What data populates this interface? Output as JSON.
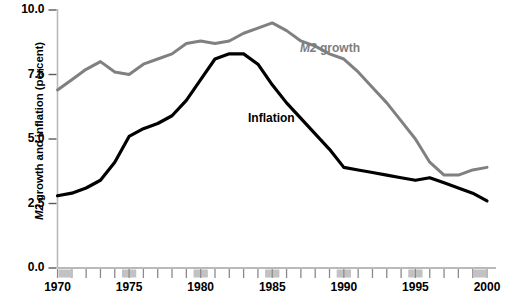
{
  "chart_data": {
    "type": "line",
    "title": "",
    "xlabel": "",
    "ylabel": "M2 growth and inflation (percent)",
    "ylabel_italic_prefix": "M2",
    "ylabel_rest": " growth and inflation (percent)",
    "xlim": [
      1970,
      2000
    ],
    "ylim": [
      0.0,
      10.0
    ],
    "grid": false,
    "legend_position": "inline-annotations",
    "ytick_labels": [
      "0.0",
      "2.5",
      "5.0",
      "7.5",
      "10.0"
    ],
    "ytick_values": [
      0.0,
      2.5,
      5.0,
      7.5,
      10.0
    ],
    "xtick_labels": [
      "1970",
      "1975",
      "1980",
      "1985",
      "1990",
      "1995",
      "2000"
    ],
    "xtick_values": [
      1970,
      1975,
      1980,
      1985,
      1990,
      1995,
      2000
    ],
    "minor_xticks": [
      1971,
      1972,
      1973,
      1974,
      1976,
      1977,
      1978,
      1979,
      1981,
      1982,
      1983,
      1984,
      1986,
      1987,
      1988,
      1989,
      1991,
      1992,
      1993,
      1994,
      1996,
      1997,
      1998,
      1999
    ],
    "x": [
      1970,
      1971,
      1972,
      1973,
      1974,
      1975,
      1976,
      1977,
      1978,
      1979,
      1980,
      1981,
      1982,
      1983,
      1984,
      1985,
      1986,
      1987,
      1988,
      1989,
      1990,
      1991,
      1992,
      1993,
      1994,
      1995,
      1996,
      1997,
      1998,
      1999,
      2000
    ],
    "series": [
      {
        "name": "M2 growth",
        "color": "#808080",
        "label_text": "M2 growth",
        "label_italic_prefix": "M2",
        "label_rest": " growth",
        "values": [
          6.9,
          7.3,
          7.7,
          8.0,
          7.6,
          7.5,
          7.9,
          8.1,
          8.3,
          8.7,
          8.8,
          8.7,
          8.8,
          9.1,
          9.3,
          9.5,
          9.2,
          8.8,
          8.6,
          8.3,
          8.1,
          7.6,
          7.0,
          6.4,
          5.7,
          5.0,
          4.1,
          3.6,
          3.6,
          3.8,
          3.9
        ]
      },
      {
        "name": "Inflation",
        "color": "#000000",
        "label_text": "Inflation",
        "label_italic_prefix": "",
        "label_rest": "Inflation",
        "values": [
          2.8,
          2.9,
          3.1,
          3.4,
          4.1,
          5.1,
          5.4,
          5.6,
          5.9,
          6.5,
          7.3,
          8.1,
          8.3,
          8.3,
          7.9,
          7.1,
          6.4,
          5.8,
          5.2,
          4.6,
          3.9,
          3.8,
          3.7,
          3.6,
          3.5,
          3.4,
          3.5,
          3.3,
          3.1,
          2.9,
          2.6
        ]
      }
    ]
  }
}
